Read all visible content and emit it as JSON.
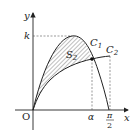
{
  "diagram": {
    "type": "function-graph",
    "axes": {
      "x_label": "x",
      "y_label": "y",
      "origin_label": "O"
    },
    "y_ticks": [
      {
        "label": "k"
      }
    ],
    "x_ticks": [
      {
        "label": "α"
      },
      {
        "label_num": "π",
        "label_den": "2"
      }
    ],
    "curves": [
      {
        "name": "C1",
        "label_main": "C",
        "label_sub": "1"
      },
      {
        "name": "C2",
        "label_main": "C",
        "label_sub": "2"
      }
    ],
    "region": {
      "label_main": "S",
      "label_sub": "2",
      "fill": "hatched"
    },
    "intersection_point": true,
    "colors": {
      "line": "#222222",
      "dashed": "#555555",
      "hatch": "#444444",
      "background": "#ffffff"
    }
  }
}
